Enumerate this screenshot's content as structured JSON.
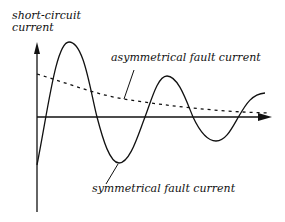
{
  "diagram": {
    "y_axis_label_line1": "short-circuit",
    "y_axis_label_line2": "current",
    "asymmetrical_label": "asymmetrical fault current",
    "symmetrical_label": "symmetrical fault current",
    "colors": {
      "line": "#111111",
      "background": "#ffffff"
    }
  }
}
